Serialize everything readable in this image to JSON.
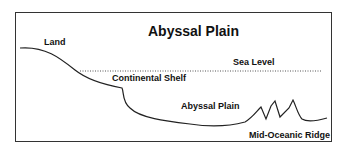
{
  "diagram": {
    "title": "Abyssal Plain",
    "labels": {
      "land": "Land",
      "sea_level": "Sea Level",
      "continental_shelf": "Continental Shelf",
      "abyssal_plain": "Abyssal Plain",
      "mid_oceanic_ridge": "Mid-Oceanic Ridge"
    },
    "colors": {
      "line": "#222222",
      "frame": "#333333",
      "sea_level_dots": "#555555",
      "background": "#ffffff"
    }
  }
}
